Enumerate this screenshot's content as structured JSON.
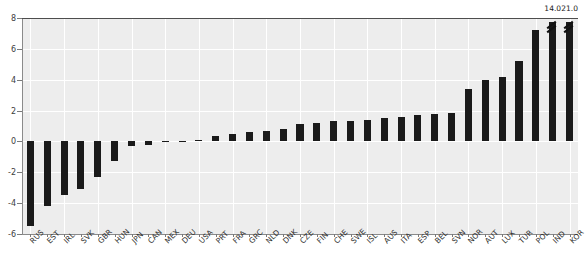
{
  "chart_data": {
    "type": "bar",
    "title": "",
    "xlabel": "",
    "ylabel": "",
    "ylim": [
      -6,
      8
    ],
    "yticks": [
      8,
      6,
      4,
      2,
      0,
      -2,
      -4,
      -6
    ],
    "ytick_labels": [
      "8",
      "6",
      "4",
      "2",
      "0",
      "-2",
      "-4",
      "-6"
    ],
    "grid": true,
    "legend": null,
    "orientation": "vertical",
    "bar_color": "#1a1a1a",
    "plot_background": "#ededed",
    "gridline_color": "#ffffff",
    "categories": [
      "RUS",
      "EST",
      "IRL",
      "SVK",
      "GBR",
      "HUN",
      "JPN",
      "CAN",
      "MEX",
      "DEU",
      "USA",
      "PRT",
      "FRA",
      "GRC",
      "NLD",
      "DNK",
      "CZE",
      "FIN",
      "CHE",
      "SWE",
      "ISL",
      "AUS",
      "ITA",
      "ESP",
      "BEL",
      "SVN",
      "NOR",
      "AUT",
      "LUX",
      "TUR",
      "POL",
      "IND",
      "KOR"
    ],
    "values": [
      -5.5,
      -4.2,
      -3.5,
      -3.1,
      -2.3,
      -1.3,
      -0.3,
      -0.25,
      -0.05,
      0.0,
      0.1,
      0.35,
      0.5,
      0.6,
      0.7,
      0.8,
      1.1,
      1.2,
      1.3,
      1.35,
      1.4,
      1.5,
      1.6,
      1.7,
      1.8,
      1.85,
      3.4,
      4.0,
      4.2,
      5.2,
      7.2,
      14.0,
      21.0
    ],
    "clipped_bars": [
      {
        "category": "IND",
        "value": 14.0,
        "label": "14.0",
        "drawn_top": 7.75
      },
      {
        "category": "KOR",
        "value": 21.0,
        "label": "21.0",
        "drawn_top": 7.75
      }
    ],
    "annotations": [
      {
        "text": "14.0",
        "for": "IND"
      },
      {
        "text": "21.0",
        "for": "KOR"
      }
    ]
  },
  "figure": {
    "clipped_title_text": ""
  }
}
